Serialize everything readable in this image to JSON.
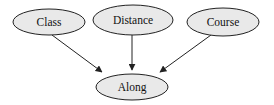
{
  "diagram": {
    "type": "directed-graph",
    "nodes": [
      {
        "id": "class",
        "label": "Class",
        "cx": 49,
        "cy": 22,
        "rx": 36,
        "ry": 13
      },
      {
        "id": "distance",
        "label": "Distance",
        "cx": 133,
        "cy": 20,
        "rx": 40,
        "ry": 15
      },
      {
        "id": "course",
        "label": "Course",
        "cx": 223,
        "cy": 22,
        "rx": 36,
        "ry": 14
      },
      {
        "id": "along",
        "label": "Along",
        "cx": 132,
        "cy": 87,
        "rx": 36,
        "ry": 13
      }
    ],
    "edges": [
      {
        "from": "class",
        "to": "along",
        "x1": 52,
        "y1": 35,
        "x2": 102,
        "y2": 72
      },
      {
        "from": "distance",
        "to": "along",
        "x1": 132,
        "y1": 35,
        "x2": 132,
        "y2": 70
      },
      {
        "from": "course",
        "to": "along",
        "x1": 211,
        "y1": 35,
        "x2": 160,
        "y2": 72
      }
    ],
    "colors": {
      "node_fill": "#e9e9e9",
      "stroke": "#222222",
      "text": "#111111"
    }
  }
}
